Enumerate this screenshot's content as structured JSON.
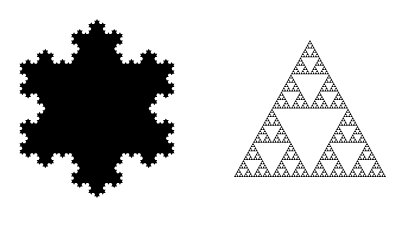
{
  "canvas": {
    "width": 403,
    "height": 230,
    "background": "#ffffff"
  },
  "figures": [
    {
      "name": "koch-snowflake",
      "type": "koch-snowflake",
      "fill": "#000000",
      "center": [
        97,
        108.5
      ],
      "tip_radius": 89.5,
      "orientation": "point-up",
      "iterations": 4
    },
    {
      "name": "sierpinski-triangle",
      "type": "sierpinski-triangle",
      "fill": "#000000",
      "apex": [
        310,
        40
      ],
      "base_left": [
        234,
        177
      ],
      "base_right": [
        386,
        177
      ],
      "iterations": 6
    }
  ]
}
